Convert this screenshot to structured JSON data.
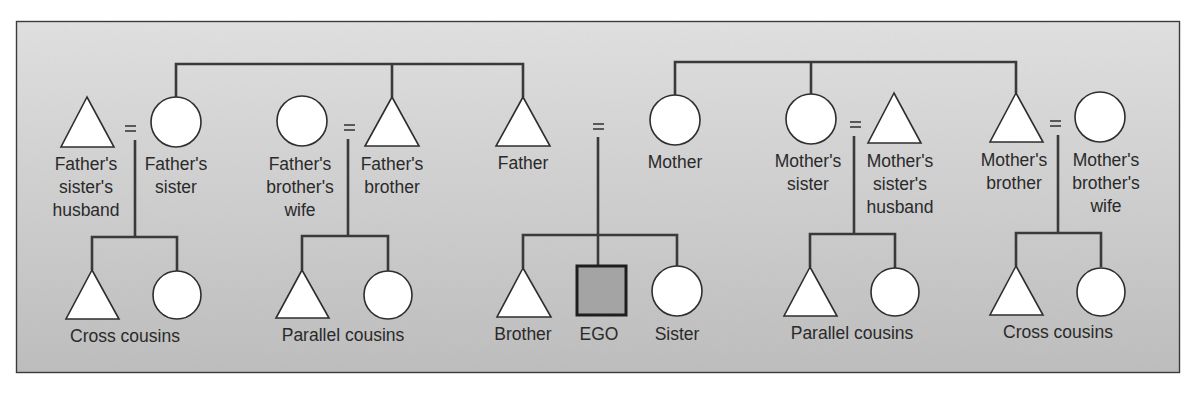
{
  "diagram": {
    "type": "kinship-chart",
    "colors": {
      "panel_bg": "#cdcdcd",
      "panel_border": "#3a3a3a",
      "line": "#3a3a3a",
      "shape_fill": "#ffffff",
      "ego_fill": "#a4a4a4"
    },
    "legend_symbols": {
      "triangle": "male",
      "circle": "female",
      "square": "ego",
      "equals": "marriage"
    },
    "father_side": {
      "fathers_sister_husband": {
        "label_lines": [
          "Father's",
          "sister's",
          "husband"
        ],
        "symbol": "triangle"
      },
      "fathers_sister": {
        "label_lines": [
          "Father's",
          "sister"
        ],
        "symbol": "circle"
      },
      "fathers_brother_wife": {
        "label_lines": [
          "Father's",
          "brother's",
          "wife"
        ],
        "symbol": "circle"
      },
      "fathers_brother": {
        "label_lines": [
          "Father's",
          "brother"
        ],
        "symbol": "triangle"
      },
      "father": {
        "label": "Father",
        "symbol": "triangle"
      },
      "cross_cousins_label": "Cross cousins",
      "parallel_cousins_label": "Parallel cousins"
    },
    "ego_family": {
      "marriage_symbol": "=",
      "brother": {
        "label": "Brother",
        "symbol": "triangle"
      },
      "ego": {
        "label": "EGO",
        "symbol": "square"
      },
      "sister": {
        "label": "Sister",
        "symbol": "circle"
      }
    },
    "mother_side": {
      "mother": {
        "label": "Mother",
        "symbol": "circle"
      },
      "mothers_sister": {
        "label_lines": [
          "Mother's",
          "sister"
        ],
        "symbol": "circle"
      },
      "mothers_sister_husband": {
        "label_lines": [
          "Mother's",
          "sister's",
          "husband"
        ],
        "symbol": "triangle"
      },
      "mothers_brother": {
        "label_lines": [
          "Mother's",
          "brother"
        ],
        "symbol": "triangle"
      },
      "mothers_brother_wife": {
        "label_lines": [
          "Mother's",
          "brother's",
          "wife"
        ],
        "symbol": "circle"
      },
      "parallel_cousins_label": "Parallel cousins",
      "cross_cousins_label": "Cross cousins"
    }
  }
}
